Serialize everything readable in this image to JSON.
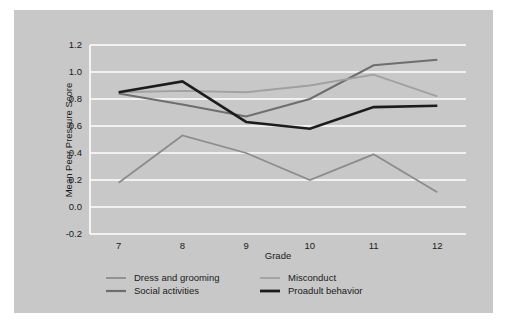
{
  "figure": {
    "background_color": "#c8c8c8",
    "page_background_color": "#ffffff"
  },
  "chart_data": {
    "type": "line",
    "title": "",
    "xlabel": "Grade",
    "ylabel": "Mean Peer Pressure Score",
    "x": [
      7,
      8,
      9,
      10,
      11,
      12
    ],
    "xtick_labels": [
      "7",
      "8",
      "9",
      "10",
      "11",
      "12"
    ],
    "ytick_labels": [
      "-0.2",
      "0.0",
      "0.2",
      "0.4",
      "0.6",
      "0.8",
      "1.0",
      "1.2"
    ],
    "ytick_values": [
      -0.2,
      0.0,
      0.2,
      0.4,
      0.6,
      0.8,
      1.0,
      1.2
    ],
    "ylim": [
      -0.2,
      1.2
    ],
    "xlim": [
      6.55,
      12.45
    ],
    "grid": "horizontal-white",
    "legend_position": "bottom",
    "series": [
      {
        "name": "Dress and grooming",
        "color": "#8c8c8c",
        "width": 1.8,
        "values": [
          0.18,
          0.53,
          0.4,
          0.2,
          0.39,
          0.11
        ]
      },
      {
        "name": "Social activities",
        "color": "#6e6e6e",
        "width": 2.0,
        "values": [
          0.84,
          0.76,
          0.67,
          0.8,
          1.05,
          1.09
        ]
      },
      {
        "name": "Misconduct",
        "color": "#a0a0a0",
        "width": 1.8,
        "values": [
          0.85,
          0.86,
          0.85,
          0.9,
          0.98,
          0.82
        ]
      },
      {
        "name": "Proadult behavior",
        "color": "#1c1c1c",
        "width": 2.6,
        "values": [
          0.85,
          0.93,
          0.63,
          0.58,
          0.74,
          0.75
        ]
      }
    ]
  },
  "legend": {
    "entries": [
      {
        "label": "Dress and grooming",
        "color": "#8c8c8c",
        "width": 1.8
      },
      {
        "label": "Social activities",
        "color": "#6e6e6e",
        "width": 2.2
      },
      {
        "label": "Misconduct",
        "color": "#a0a0a0",
        "width": 1.8
      },
      {
        "label": "Proadult behavior",
        "color": "#1c1c1c",
        "width": 2.8
      }
    ]
  }
}
